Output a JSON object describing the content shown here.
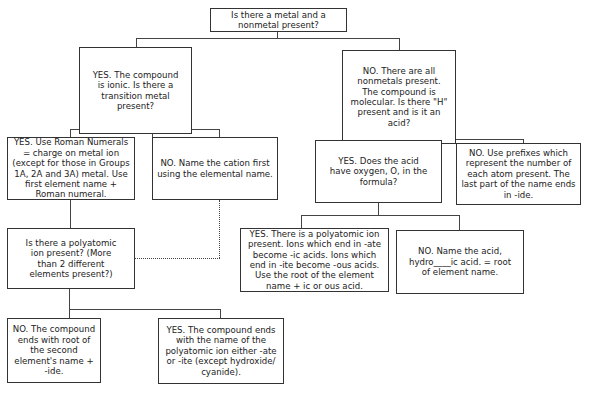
{
  "diagram": {
    "type": "flowchart",
    "nodes": {
      "root": "Is there a metal and a nonmetal present?",
      "ionic": "YES. The compound is ionic. Is there a transition metal present?",
      "molecular": "NO. There are all nonmetals present. The compound is molecular. Is there \"H\" present and is it an acid?",
      "roman": "YES.  Use Roman Numerals = charge on metal ion (except for those in Groups 1A, 2A and 3A) metal. Use first element name + Roman numeral.",
      "cation": "NO. Name the cation first using the elemental name.",
      "polyatomic_q": "Is there a polyatomic ion present? (More than 2 different elements present?)",
      "binary_end": "NO. The compound ends with root of the second element's name + -ide.",
      "polyatomic_end": "YES. The compound ends with the name of the polyatomic ion either -ate or -ite (except hydroxide/ cyanide).",
      "acid_oxygen": "YES. Does the acid have oxygen, O, in the formula?",
      "prefixes": "NO. Use prefixes which represent  the number of each atom present.  The last part of the name ends in -ide.",
      "oxyacid": "YES. There is a polyatomic ion present. Ions which end in -ate become -ic acids. Ions which end in -ite become -ous acids. Use the root of the element name + ic or ous acid.",
      "hydro_acid": "NO. Name the acid, hydro____ic acid. = root of element name."
    },
    "edges": [
      {
        "from": "root",
        "to": "ionic",
        "style": "solid"
      },
      {
        "from": "root",
        "to": "molecular",
        "style": "solid"
      },
      {
        "from": "ionic",
        "to": "roman",
        "style": "solid"
      },
      {
        "from": "ionic",
        "to": "cation",
        "style": "solid"
      },
      {
        "from": "roman",
        "to": "polyatomic_q",
        "style": "solid"
      },
      {
        "from": "cation",
        "to": "polyatomic_q",
        "style": "dotted"
      },
      {
        "from": "polyatomic_q",
        "to": "binary_end",
        "style": "solid"
      },
      {
        "from": "polyatomic_q",
        "to": "polyatomic_end",
        "style": "solid"
      },
      {
        "from": "molecular",
        "to": "acid_oxygen",
        "style": "solid"
      },
      {
        "from": "molecular",
        "to": "prefixes",
        "style": "solid"
      },
      {
        "from": "acid_oxygen",
        "to": "oxyacid",
        "style": "solid"
      },
      {
        "from": "acid_oxygen",
        "to": "hydro_acid",
        "style": "solid"
      }
    ],
    "colors": {
      "border": "#333333",
      "background": "#ffffff",
      "text": "#222222"
    }
  }
}
